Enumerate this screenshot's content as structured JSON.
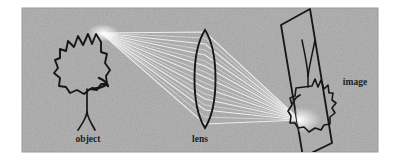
{
  "figure": {
    "background_color": "#ffffff",
    "panel_color": "#a9a9a9",
    "ink_color": "#1a1a1a",
    "ray_color": "#f2f2f2",
    "panel": {
      "x": 22,
      "y": 8,
      "width": 356,
      "height": 144
    },
    "labels": {
      "object": "object",
      "lens": "lens",
      "image": "image"
    },
    "elements": [
      {
        "name": "object-tree",
        "label": "object",
        "role": "light-source-object"
      },
      {
        "name": "converging-lens",
        "label": "lens",
        "role": "biconvex-lens"
      },
      {
        "name": "projection-screen",
        "label": "image",
        "role": "screen-with-inverted-image"
      },
      {
        "name": "light-rays",
        "label": "",
        "role": "ray-bundle"
      }
    ],
    "ray_count": 9,
    "object_apex": {
      "x": 101,
      "y": 33
    },
    "image_point": {
      "x": 300,
      "y": 120
    },
    "lens_center": {
      "x": 205,
      "y": 79
    }
  }
}
